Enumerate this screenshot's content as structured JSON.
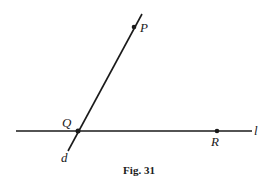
{
  "figure": {
    "caption": "Fig. 31",
    "line_color": "#1a1a1a",
    "lines": [
      {
        "name": "l",
        "label": "l",
        "x1": 16,
        "y1": 131,
        "x2": 252,
        "y2": 131
      },
      {
        "name": "d",
        "label": "d",
        "x1": 142,
        "y1": 14,
        "x2": 68,
        "y2": 151
      }
    ],
    "points": [
      {
        "name": "P",
        "label": "P",
        "x": 134,
        "y": 27
      },
      {
        "name": "Q",
        "label": "Q",
        "x": 78,
        "y": 131
      },
      {
        "name": "R",
        "label": "R",
        "x": 217,
        "y": 131
      }
    ],
    "labels": {
      "P": "P",
      "Q": "Q",
      "R": "R",
      "l": "l",
      "d": "d"
    }
  }
}
